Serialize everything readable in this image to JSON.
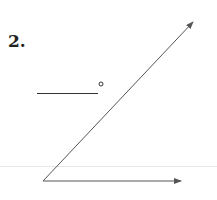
{
  "problem": {
    "number_label": "2.",
    "answer_blank": "",
    "unit_symbol": "degree"
  },
  "diagram": {
    "type": "angle",
    "vertex": [
      43,
      181
    ],
    "ray_horizontal_end": [
      181,
      181
    ],
    "ray_diagonal_end": [
      193,
      22
    ],
    "line_color": "#555555"
  }
}
